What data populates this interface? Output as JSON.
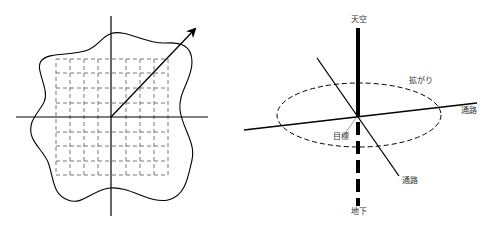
{
  "left_diagram": {
    "description": "Coordinate axes with dashed grid, wavy boundary and diagonal arrow",
    "grid": {
      "columns": 8,
      "rows": 8
    }
  },
  "right_diagram": {
    "labels": {
      "sky": "天空",
      "underground": "地下",
      "spread": "拡がり",
      "passage_right": "通路",
      "passage_bottom": "通路",
      "target": "目標"
    }
  },
  "colors": {
    "line": "#000000",
    "grid": "#555555",
    "text": "#333333"
  }
}
